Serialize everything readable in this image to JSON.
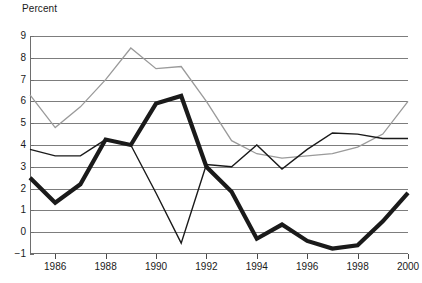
{
  "chart_data": {
    "type": "line",
    "title": "",
    "ylabel": "Percent",
    "xlabel": "",
    "ylim": [
      -1,
      9
    ],
    "xlim": [
      1985,
      2000
    ],
    "grid": true,
    "legend_position": "none",
    "yticks": [
      "9",
      "8",
      "7",
      "6",
      "5",
      "4",
      "3",
      "2",
      "1",
      "0",
      "−1"
    ],
    "ytick_values": [
      9,
      8,
      7,
      6,
      5,
      4,
      3,
      2,
      1,
      0,
      -1
    ],
    "xticks": [
      "1986",
      "1988",
      "1990",
      "1992",
      "1994",
      "1996",
      "1998",
      "2000"
    ],
    "xtick_values": [
      1986,
      1988,
      1990,
      1992,
      1994,
      1996,
      1998,
      2000
    ],
    "x": [
      1985,
      1986,
      1987,
      1988,
      1989,
      1990,
      1991,
      1992,
      1993,
      1994,
      1995,
      1996,
      1997,
      1998,
      1999,
      2000
    ],
    "series": [
      {
        "name": "series-gray",
        "color": "#9a9a9a",
        "width": 1.3,
        "values": [
          6.3,
          4.8,
          5.75,
          7.0,
          8.45,
          7.5,
          7.6,
          6.0,
          4.2,
          3.6,
          3.4,
          3.5,
          3.6,
          3.9,
          4.5,
          6.0
        ]
      },
      {
        "name": "series-thin-black",
        "color": "#1a1a1a",
        "width": 1.4,
        "values": [
          3.8,
          3.5,
          3.5,
          4.25,
          4.0,
          1.8,
          -0.5,
          3.1,
          3.0,
          4.0,
          2.9,
          3.8,
          4.55,
          4.5,
          4.3,
          4.3
        ]
      },
      {
        "name": "series-thick-black",
        "color": "#1a1a1a",
        "width": 4.2,
        "values": [
          2.5,
          1.35,
          2.2,
          4.25,
          4.0,
          5.9,
          6.25,
          3.0,
          1.85,
          -0.3,
          0.35,
          -0.4,
          -0.75,
          -0.6,
          0.5,
          1.8
        ]
      }
    ]
  }
}
